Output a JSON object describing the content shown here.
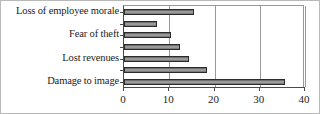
{
  "chart_data": {
    "type": "bar",
    "orientation": "horizontal",
    "title": "",
    "subtitle": "",
    "xlabel": "",
    "ylabel": "",
    "xlim": [
      0,
      40
    ],
    "xticks": [
      0,
      10,
      20,
      30,
      40
    ],
    "xtick_labels": [
      "0",
      "10",
      "20",
      "30",
      "40"
    ],
    "grid": "vertical",
    "legend": "none",
    "categories": [
      "Loss of employee morale",
      "",
      "Fear of theft",
      "",
      "Lost revenues",
      "",
      "Damage to image"
    ],
    "labeled_categories": [
      "Loss of employee morale",
      "Fear of theft",
      "Lost revenues",
      "Damage to image"
    ],
    "values": [
      15.5,
      7.4,
      10.3,
      12.3,
      14.4,
      18.3,
      35.5
    ],
    "bar_fill_color": "#8a8a8a",
    "bar_edge_color": "#2b2b2b",
    "axis_color": "#4a4a4a",
    "grid_color": "#9a9a9a",
    "background_color": "#ffffff"
  }
}
